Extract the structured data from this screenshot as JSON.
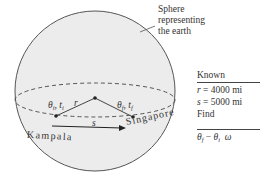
{
  "diagram": {
    "sphere_label": [
      "Sphere",
      "representing",
      "the earth"
    ],
    "points": {
      "start": {
        "city": "Kampala",
        "theta": "θ",
        "theta_sub": "i",
        "t": "t",
        "t_sub": "i"
      },
      "end": {
        "city": "Singapore",
        "theta": "θ",
        "theta_sub": "f",
        "t": "t",
        "t_sub": "f"
      }
    },
    "radius_label": "r",
    "arc_label": "s",
    "colors": {
      "sphere_fill": "#ececec",
      "stroke": "#444444"
    }
  },
  "known": {
    "header": "Known",
    "items": [
      {
        "var": "r",
        "value": " = 4000 mi"
      },
      {
        "var": "s",
        "value": " = 5000 mi"
      }
    ],
    "find_header": "Find",
    "find": {
      "a": "θ",
      "a_sub": "f",
      "op": " − ",
      "b": "θ",
      "b_sub": "i",
      "c": "ω"
    }
  }
}
